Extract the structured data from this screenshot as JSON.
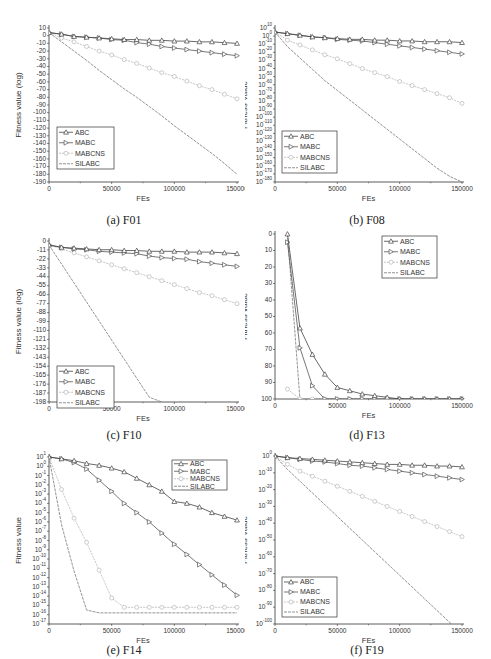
{
  "figure": {
    "x_label": "FEs",
    "x_ticks": [
      "0",
      "50000",
      "100000",
      "150000"
    ],
    "series_names": [
      "ABC",
      "MABC",
      "MABCNS",
      "SILABC"
    ],
    "series_styles": {
      "ABC": {
        "color": "#444444",
        "marker": "triangle-up",
        "dash": ""
      },
      "MABC": {
        "color": "#555555",
        "marker": "triangle-right",
        "dash": ""
      },
      "MABCNS": {
        "color": "#b8b8b8",
        "marker": "circle",
        "dash": "2,1"
      },
      "SILABC": {
        "color": "#777777",
        "marker": "none",
        "dash": "3,1"
      }
    }
  },
  "chart_data": [
    {
      "id": "a",
      "caption": "(a) F01",
      "type": "line",
      "title": "F01",
      "xlabel": "FEs",
      "ylabel": "Fitness value (log)",
      "xlim": [
        0,
        150000
      ],
      "ylim": [
        -190,
        10
      ],
      "y_ticks": [
        "10",
        "0",
        "-10",
        "-20",
        "-30",
        "-40",
        "-50",
        "-60",
        "-70",
        "-80",
        "-90",
        "-100",
        "-110",
        "-120",
        "-130",
        "-140",
        "-150",
        "-160",
        "-170",
        "-180",
        "-190"
      ],
      "legend_position": "lower-left",
      "x": [
        0,
        10000,
        20000,
        30000,
        40000,
        50000,
        60000,
        70000,
        80000,
        90000,
        100000,
        110000,
        120000,
        130000,
        140000,
        150000
      ],
      "series": [
        {
          "name": "ABC",
          "values": [
            4,
            2,
            -1,
            -2,
            -3,
            -4,
            -5,
            -5,
            -6,
            -6,
            -7,
            -7,
            -8,
            -8,
            -9,
            -10
          ]
        },
        {
          "name": "MABC",
          "values": [
            4,
            2,
            -1,
            -2,
            -3,
            -5,
            -6,
            -9,
            -11,
            -14,
            -16,
            -18,
            -20,
            -22,
            -24,
            -26
          ]
        },
        {
          "name": "MABCNS",
          "values": [
            4,
            -3,
            -8,
            -14,
            -20,
            -25,
            -31,
            -36,
            -42,
            -48,
            -53,
            -59,
            -65,
            -70,
            -76,
            -82
          ]
        },
        {
          "name": "SILABC",
          "values": [
            4,
            -8,
            -20,
            -32,
            -45,
            -57,
            -69,
            -80,
            -92,
            -104,
            -117,
            -129,
            -141,
            -153,
            -166,
            -180
          ]
        }
      ]
    },
    {
      "id": "b",
      "caption": "(b) F08",
      "type": "line",
      "title": "F08",
      "xlabel": "FEs",
      "ylabel": "Fitness Value",
      "y_scale": "log10",
      "xlim": [
        0,
        150000
      ],
      "ylim_exponent": [
        -180,
        10
      ],
      "y_ticks": [
        "10^10",
        "10^0",
        "10^-10",
        "10^-20",
        "10^-30",
        "10^-40",
        "10^-50",
        "10^-60",
        "10^-70",
        "10^-80",
        "10^-90",
        "10^-100",
        "10^-110",
        "10^-120",
        "10^-130",
        "10^-140",
        "10^-150",
        "10^-160",
        "10^-170",
        "10^-180"
      ],
      "legend_position": "lower-left",
      "x": [
        0,
        10000,
        20000,
        30000,
        40000,
        50000,
        60000,
        70000,
        80000,
        90000,
        100000,
        110000,
        120000,
        130000,
        140000,
        150000
      ],
      "series": [
        {
          "name": "ABC",
          "values_exponent": [
            5,
            3,
            1,
            -1,
            -2,
            -3,
            -4,
            -4,
            -5,
            -5,
            -6,
            -6,
            -7,
            -7,
            -7,
            -8
          ]
        },
        {
          "name": "MABC",
          "values_exponent": [
            5,
            3,
            1,
            -1,
            -2,
            -4,
            -5,
            -6,
            -8,
            -10,
            -12,
            -14,
            -16,
            -18,
            -20,
            -22
          ]
        },
        {
          "name": "MABCNS",
          "values_exponent": [
            5,
            -5,
            -11,
            -17,
            -23,
            -28,
            -34,
            -40,
            -45,
            -50,
            -56,
            -61,
            -66,
            -71,
            -76,
            -83
          ]
        },
        {
          "name": "SILABC",
          "values_exponent": [
            5,
            -13,
            -27,
            -41,
            -55,
            -67,
            -79,
            -91,
            -103,
            -115,
            -127,
            -139,
            -151,
            -163,
            -173,
            -180
          ]
        }
      ]
    },
    {
      "id": "c",
      "caption": "(c) F10",
      "type": "line",
      "title": "F10",
      "xlabel": "FEs",
      "ylabel": "Fitness value (log)",
      "xlim": [
        0,
        150000
      ],
      "ylim": [
        -198,
        5
      ],
      "y_ticks": [
        "0",
        "-11",
        "-22",
        "-33",
        "-44",
        "-55",
        "-66",
        "-77",
        "-88",
        "-99",
        "-110",
        "-121",
        "-132",
        "-143",
        "-154",
        "-165",
        "-176",
        "-187",
        "-198"
      ],
      "legend_position": "lower-left",
      "x": [
        0,
        10000,
        20000,
        30000,
        40000,
        50000,
        60000,
        70000,
        80000,
        90000,
        100000,
        110000,
        120000,
        130000,
        140000,
        150000
      ],
      "series": [
        {
          "name": "ABC",
          "values": [
            0,
            -3,
            -4,
            -5,
            -6,
            -6,
            -7,
            -7,
            -8,
            -8,
            -8,
            -9,
            -9,
            -9,
            -10,
            -11
          ]
        },
        {
          "name": "MABC",
          "values": [
            0,
            -3,
            -5,
            -6,
            -8,
            -9,
            -10,
            -11,
            -14,
            -16,
            -17,
            -18,
            -21,
            -23,
            -25,
            -27
          ]
        },
        {
          "name": "MABCNS",
          "values": [
            0,
            -5,
            -10,
            -15,
            -20,
            -25,
            -30,
            -35,
            -40,
            -45,
            -50,
            -55,
            -60,
            -64,
            -69,
            -74
          ]
        },
        {
          "name": "SILABC",
          "values": [
            0,
            -24,
            -48,
            -72,
            -96,
            -120,
            -144,
            -168,
            -192,
            -198,
            null,
            null,
            null,
            null,
            null,
            null
          ]
        }
      ]
    },
    {
      "id": "d",
      "caption": "(d) F13",
      "type": "line",
      "title": "F13",
      "xlabel": "FEs",
      "ylabel": "Fitness value",
      "xlim": [
        0,
        150000
      ],
      "ylim": [
        0,
        100
      ],
      "y_ticks": [
        "0",
        "10",
        "20",
        "30",
        "40",
        "50",
        "60",
        "70",
        "80",
        "90",
        "100"
      ],
      "legend_position": "upper-right",
      "x": [
        10000,
        20000,
        30000,
        40000,
        50000,
        60000,
        70000,
        80000,
        90000,
        100000,
        110000,
        120000,
        130000,
        140000,
        150000
      ],
      "series": [
        {
          "name": "ABC",
          "values": [
            100,
            43,
            27,
            15,
            7,
            5,
            3,
            2,
            1,
            0,
            0,
            0,
            0,
            0,
            0
          ]
        },
        {
          "name": "MABC",
          "values": [
            95,
            31,
            8,
            0,
            0,
            0,
            0,
            0,
            0,
            0,
            0,
            0,
            0,
            0,
            0
          ]
        },
        {
          "name": "MABCNS",
          "values": [
            6,
            0,
            0,
            0,
            0,
            0,
            0,
            0,
            0,
            0,
            0,
            0,
            0,
            0,
            0
          ]
        },
        {
          "name": "SILABC",
          "values": [
            100,
            0,
            0,
            0,
            0,
            0,
            0,
            0,
            0,
            0,
            0,
            0,
            0,
            0,
            0
          ]
        }
      ]
    },
    {
      "id": "e",
      "caption": "(e) F14",
      "type": "line",
      "title": "F14",
      "xlabel": "FEs",
      "ylabel": "Fitness value",
      "y_scale": "log10",
      "xlim": [
        0,
        150000
      ],
      "ylim_exponent": [
        -17,
        1
      ],
      "y_ticks": [
        "10^1",
        "10^0",
        "10^-1",
        "10^-2",
        "10^-3",
        "10^-4",
        "10^-5",
        "10^-6",
        "10^-7",
        "10^-8",
        "10^-9",
        "10^-10",
        "10^-11",
        "10^-12",
        "10^-13",
        "10^-14",
        "10^-15",
        "10^-16",
        "10^-17"
      ],
      "legend_position": "upper-right",
      "x": [
        0,
        10000,
        20000,
        30000,
        40000,
        50000,
        60000,
        70000,
        80000,
        90000,
        100000,
        110000,
        120000,
        130000,
        140000,
        150000
      ],
      "series": [
        {
          "name": "ABC",
          "values_exponent": [
            1,
            0.8,
            0.6,
            0.3,
            0.1,
            -0.2,
            -0.6,
            -1.3,
            -2.0,
            -2.7,
            -3.8,
            -4.0,
            -4.4,
            -5.0,
            -5.4,
            -5.8
          ]
        },
        {
          "name": "MABC",
          "values_exponent": [
            1,
            0.8,
            0.4,
            -0.3,
            -1.5,
            -2.7,
            -4.0,
            -5.0,
            -6.0,
            -7.2,
            -8.4,
            -9.5,
            -10.6,
            -11.7,
            -12.8,
            -13.9
          ]
        },
        {
          "name": "MABCNS",
          "values_exponent": [
            1,
            -2.5,
            -5.6,
            -8.2,
            -11.2,
            -14.2,
            -15.2,
            -15.2,
            -15.2,
            -15.2,
            -15.2,
            -15.2,
            -15.2,
            -15.2,
            -15.2,
            -15.2
          ]
        },
        {
          "name": "SILABC",
          "values_exponent": [
            1,
            -6.3,
            -11.3,
            -15.5,
            -15.8,
            -15.8,
            -15.8,
            -15.8,
            -15.8,
            -15.8,
            -15.8,
            -15.8,
            -15.8,
            -15.8,
            -15.8,
            -15.8
          ]
        }
      ]
    },
    {
      "id": "f",
      "caption": "(f) F19",
      "type": "line",
      "title": "F19",
      "xlabel": "FEs",
      "ylabel": "Fitness Value",
      "y_scale": "log10",
      "xlim": [
        0,
        150000
      ],
      "ylim_exponent": [
        -100,
        0
      ],
      "y_ticks": [
        "10^0",
        "10^-10",
        "10^-20",
        "10^-30",
        "10^-40",
        "10^-50",
        "10^-60",
        "10^-70",
        "10^-80",
        "10^-90",
        "10^-100"
      ],
      "legend_position": "lower-left",
      "x": [
        0,
        10000,
        20000,
        30000,
        40000,
        50000,
        60000,
        70000,
        80000,
        90000,
        100000,
        110000,
        120000,
        130000,
        140000,
        150000
      ],
      "series": [
        {
          "name": "ABC",
          "values_exponent": [
            0,
            -1,
            -1.5,
            -2,
            -2.5,
            -3,
            -3.5,
            -4,
            -4.5,
            -5,
            -5,
            -5.5,
            -5.5,
            -6,
            -6,
            -6.5
          ]
        },
        {
          "name": "MABC",
          "values_exponent": [
            0,
            -1,
            -2,
            -3,
            -3.5,
            -4.5,
            -5.5,
            -6,
            -7,
            -8,
            -9,
            -10,
            -11,
            -12,
            -13,
            -14
          ]
        },
        {
          "name": "MABCNS",
          "values_exponent": [
            0,
            -5,
            -9,
            -12,
            -15,
            -18,
            -21,
            -24,
            -27,
            -30,
            -33,
            -36,
            -39,
            -42,
            -45,
            -48
          ]
        },
        {
          "name": "SILABC",
          "values_exponent": [
            0,
            -8,
            -15,
            -22,
            -29,
            -36,
            -43,
            -50,
            -57,
            -64,
            -71,
            -78,
            -85,
            -92,
            -99,
            -106
          ]
        }
      ]
    }
  ]
}
